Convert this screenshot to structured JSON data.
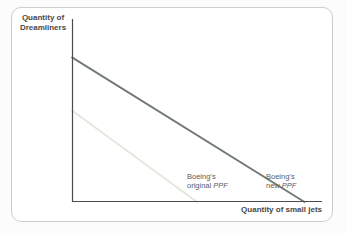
{
  "figure": {
    "y_axis_label_line1": "Quantity of",
    "y_axis_label_line2": "Dreamliners",
    "x_axis_label": "Quantity of small jets"
  },
  "chart_data": {
    "type": "line",
    "title": "",
    "xlabel": "Quantity of small jets",
    "ylabel": "Quantity of Dreamliners",
    "axis_color": "#4b4c4e",
    "grid": false,
    "ticks": "none",
    "xlim": [
      0,
      1
    ],
    "ylim": [
      0,
      1
    ],
    "note": "No numeric tick labels shown; intercepts are relative fractions of axis length",
    "series": [
      {
        "name": "Boeing's original PPF",
        "color": "#e3e8da",
        "stroke_width": 1.8,
        "points": [
          [
            0,
            0.5
          ],
          [
            0.5,
            0
          ]
        ],
        "label": {
          "line1": "Boeing’s",
          "line2_prefix": "original ",
          "line2_italic": "PPF"
        }
      },
      {
        "name": "Boeing's new PPF",
        "color": "#717a71",
        "stroke_width": 1.9,
        "points": [
          [
            0,
            0.79
          ],
          [
            0.93,
            0
          ]
        ],
        "label": {
          "line1": "Boeing’s",
          "line2_prefix": "new ",
          "line2_italic": "PPF"
        }
      }
    ]
  }
}
